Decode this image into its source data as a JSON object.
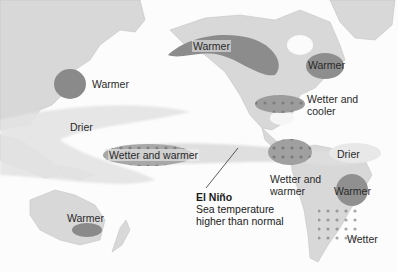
{
  "map": {
    "title": "El Niño",
    "subtitle_line1": "Sea temperature",
    "subtitle_line2": "higher than normal",
    "colors": {
      "land": "#d6d6d6",
      "ocean": "#fcfcfc",
      "warmer_region": "#8a8a8a",
      "drier_region": "#e2e2e2",
      "wetter_region": "#9a9a9a",
      "raindrop": "#7a7a7a",
      "text": "#2a2a2a"
    },
    "labels": {
      "east_asia_warmer": "Warmer",
      "alaska_canada_warmer": "Warmer",
      "atlantic_canada_warmer": "Warmer",
      "us_south": "Wetter and",
      "us_south_2": "cooler",
      "indonesia_drier": "Drier",
      "central_pacific": "Wetter and warmer",
      "australia_warmer": "Warmer",
      "south_america_west": "Wetter and",
      "south_america_west_2": "warmer",
      "northern_south_america_drier": "Drier",
      "brazil_warmer": "Warmer",
      "southeast_south_america": "Wetter"
    }
  }
}
